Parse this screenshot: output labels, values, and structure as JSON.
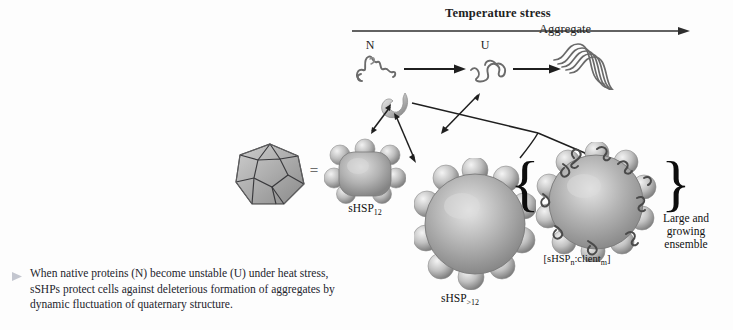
{
  "figure": {
    "header": {
      "stress_label": "Temperature stress",
      "arrow_icon": "right-arrow-icon"
    },
    "pathway": {
      "native_label": "N",
      "unfolded_label": "U",
      "aggregate_label": "Aggregate"
    },
    "complexes": {
      "dodecahedron_name": "dodecahedron-wireframe",
      "equals_sign": "=",
      "shsp12_label": "sHSP",
      "shsp12_subscript": "12",
      "shsp_gt12_label": "sHSP",
      "shsp_gt12_subscript": ">12",
      "client_complex_label_open": "[sHSP",
      "client_complex_sub_n": "n",
      "client_complex_mid": ":client",
      "client_complex_sub_m": "m",
      "client_complex_close": "]",
      "ensemble_line1": "Large and",
      "ensemble_line2": "growing",
      "ensemble_line3": "ensemble",
      "brace_left": "{",
      "brace_right": "}"
    },
    "caption": {
      "bullet_icon": "triangle-bullet-icon",
      "text": "When native proteins (N) become unstable (U) under heat stress, sSHPs protect cells against deleterious formation of aggregates by dynamic fluctuation of quaternary structure."
    },
    "colors": {
      "background": "#fdfdfd",
      "ink": "#1a1a1a",
      "arrow": "#2b2b2b",
      "sphere_light": "#e8e8e8",
      "sphere_mid": "#a8a8a8",
      "sphere_dark": "#6e6e6e",
      "squiggle": "#555555",
      "caption_text": "#23242c"
    }
  }
}
